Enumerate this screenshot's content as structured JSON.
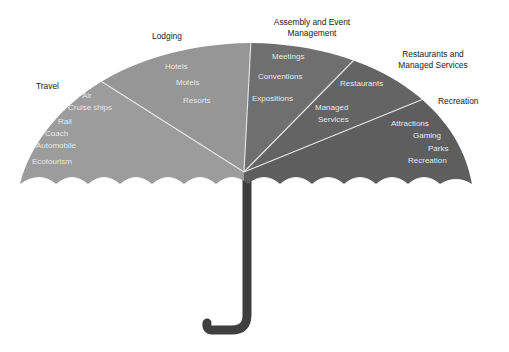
{
  "diagram": {
    "type": "umbrella",
    "colors": {
      "light_segment": "#9c9c9c",
      "mid_segment": "#6f6f6f",
      "dark_segment": "#5e5e5e",
      "divider": "#e6e6e6",
      "handle": "#3f3f3f"
    },
    "segments": [
      {
        "label": "Travel",
        "items": [
          "Air",
          "Cruise ships",
          "Rail",
          "Coach",
          "Automobile",
          "Ecotourism"
        ]
      },
      {
        "label": "Lodging",
        "items": [
          "Hotels",
          "Motels",
          "Resorts"
        ]
      },
      {
        "label_line1": "Assembly and Event",
        "label_line2": "Management",
        "items": [
          "Meetings",
          "Conventions",
          "Expositions"
        ]
      },
      {
        "label_line1": "Restaurants and",
        "label_line2": "Managed Services",
        "items": [
          "Restaurants",
          "Managed",
          "Services"
        ]
      },
      {
        "label": "Recreation",
        "items": [
          "Attractions",
          "Gaming",
          "Parks",
          "Recreation"
        ]
      }
    ]
  }
}
